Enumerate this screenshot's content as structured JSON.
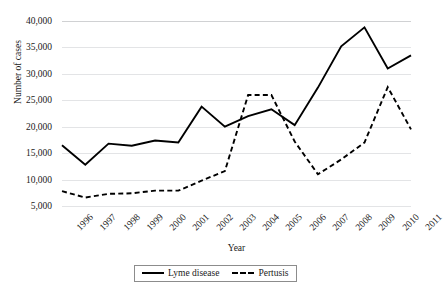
{
  "chart_data": {
    "type": "line",
    "title": "",
    "xlabel": "Year",
    "ylabel": "Number of cases",
    "x": [
      1996,
      1997,
      1998,
      1999,
      2000,
      2001,
      2002,
      2003,
      2004,
      2005,
      2006,
      2007,
      2008,
      2009,
      2010,
      2011
    ],
    "xticklabels": [
      "1996",
      "1997",
      "1998",
      "1999",
      "2000",
      "2001",
      "2002",
      "2003",
      "2004",
      "2005",
      "2006",
      "2007",
      "2008",
      "2009",
      "2010",
      "2011"
    ],
    "ylim": [
      5000,
      40000
    ],
    "yticks": [
      5000,
      10000,
      15000,
      20000,
      25000,
      30000,
      35000,
      40000
    ],
    "yticklabels": [
      "5,000",
      "10,000",
      "15,000",
      "20,000",
      "25,000",
      "30,000",
      "35,000",
      "40,000"
    ],
    "grid": true,
    "grid_axis": "y",
    "legend_position": "bottom",
    "series": [
      {
        "name": "Lyme disease",
        "style": "solid",
        "color": "#000000",
        "values": [
          16500,
          12800,
          16800,
          16400,
          17400,
          17000,
          23800,
          20000,
          22000,
          23300,
          20300,
          27400,
          35200,
          38800,
          31000,
          33500
        ]
      },
      {
        "name": "Pertusis",
        "style": "dashed",
        "color": "#000000",
        "values": [
          7800,
          6600,
          7300,
          7400,
          7900,
          7900,
          9800,
          11600,
          26000,
          26000,
          17200,
          11000,
          13800,
          17000,
          27500,
          19500
        ]
      }
    ]
  },
  "legend": {
    "entries": [
      {
        "label": "Lyme disease"
      },
      {
        "label": "Pertusis"
      }
    ]
  }
}
